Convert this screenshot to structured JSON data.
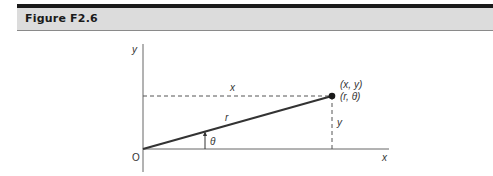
{
  "header": {
    "title": "Figure F2.6"
  },
  "diagram": {
    "axes": {
      "x_label": "x",
      "y_label": "y",
      "origin_label": "O"
    },
    "point": {
      "cartesian_label": "(x, y)",
      "polar_label": "(r, θ)"
    },
    "segment_labels": {
      "horizontal_distance": "x",
      "vertical_distance": "y",
      "radius": "r",
      "angle": "θ"
    },
    "colors": {
      "line": "#333333",
      "axis": "#555555",
      "header_bg": "#dcdcdc",
      "header_border": "#1a1a1a"
    }
  }
}
